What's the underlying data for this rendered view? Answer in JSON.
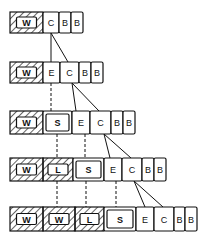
{
  "diagram": {
    "kind": "stack-of-cell-rows",
    "line_color": "#111111",
    "background": "#ffffff",
    "rows": [
      {
        "y": 12,
        "h": 21,
        "cells": [
          {
            "label": "W",
            "x": 10,
            "w": 33,
            "style": "hatched"
          },
          {
            "label": "C",
            "x": 43,
            "w": 16,
            "style": "plain"
          },
          {
            "label": "B",
            "x": 59,
            "w": 12,
            "style": "plain"
          },
          {
            "label": "B",
            "x": 71,
            "w": 12,
            "style": "plain"
          }
        ]
      },
      {
        "y": 62,
        "h": 21,
        "cells": [
          {
            "label": "W",
            "x": 10,
            "w": 33,
            "style": "hatched"
          },
          {
            "label": "E",
            "x": 43,
            "w": 17,
            "style": "plain"
          },
          {
            "label": "C",
            "x": 60,
            "w": 19,
            "style": "plain"
          },
          {
            "label": "B",
            "x": 79,
            "w": 12,
            "style": "plain"
          },
          {
            "label": "B",
            "x": 91,
            "w": 12,
            "style": "plain"
          }
        ]
      },
      {
        "y": 111,
        "h": 23,
        "cells": [
          {
            "label": "W",
            "x": 10,
            "w": 33,
            "style": "hatched"
          },
          {
            "label": "S",
            "x": 43,
            "w": 29,
            "style": "double"
          },
          {
            "label": "E",
            "x": 72,
            "w": 18,
            "style": "plain"
          },
          {
            "label": "C",
            "x": 90,
            "w": 21,
            "style": "plain"
          },
          {
            "label": "B",
            "x": 111,
            "w": 12,
            "style": "plain"
          },
          {
            "label": "B",
            "x": 123,
            "w": 12,
            "style": "plain"
          }
        ]
      },
      {
        "y": 158,
        "h": 23,
        "cells": [
          {
            "label": "W",
            "x": 10,
            "w": 33,
            "style": "hatched"
          },
          {
            "label": "L",
            "x": 43,
            "w": 30,
            "style": "hatched"
          },
          {
            "label": "S",
            "x": 73,
            "w": 31,
            "style": "double"
          },
          {
            "label": "E",
            "x": 104,
            "w": 18,
            "style": "plain"
          },
          {
            "label": "C",
            "x": 122,
            "w": 20,
            "style": "plain"
          },
          {
            "label": "B",
            "x": 142,
            "w": 12,
            "style": "plain"
          },
          {
            "label": "B",
            "x": 154,
            "w": 12,
            "style": "plain"
          }
        ]
      },
      {
        "y": 207,
        "h": 24,
        "cells": [
          {
            "label": "W",
            "x": 10,
            "w": 33,
            "style": "hatched"
          },
          {
            "label": "W",
            "x": 43,
            "w": 32,
            "style": "hatched"
          },
          {
            "label": "L",
            "x": 75,
            "w": 29,
            "style": "hatched"
          },
          {
            "label": "S",
            "x": 104,
            "w": 32,
            "style": "double"
          },
          {
            "label": "E",
            "x": 136,
            "w": 18,
            "style": "plain"
          },
          {
            "label": "C",
            "x": 154,
            "w": 20,
            "style": "plain"
          },
          {
            "label": "B",
            "x": 174,
            "w": 11,
            "style": "plain"
          },
          {
            "label": "B",
            "x": 185,
            "w": 12,
            "style": "plain"
          }
        ]
      }
    ],
    "connectors": [
      {
        "type": "solid",
        "x1": 51,
        "y1": 33,
        "x2": 51,
        "y2": 62
      },
      {
        "type": "solid",
        "x1": 51,
        "y1": 33,
        "x2": 68,
        "y2": 62
      },
      {
        "type": "dashed",
        "x1": 51,
        "y1": 83,
        "x2": 51,
        "y2": 111
      },
      {
        "type": "solid",
        "x1": 72,
        "y1": 83,
        "x2": 76,
        "y2": 111
      },
      {
        "type": "solid",
        "x1": 72,
        "y1": 83,
        "x2": 99,
        "y2": 111
      },
      {
        "type": "dashed",
        "x1": 57,
        "y1": 134,
        "x2": 57,
        "y2": 158
      },
      {
        "type": "dashed",
        "x1": 85,
        "y1": 134,
        "x2": 85,
        "y2": 158
      },
      {
        "type": "solid",
        "x1": 104,
        "y1": 134,
        "x2": 110,
        "y2": 158
      },
      {
        "type": "solid",
        "x1": 104,
        "y1": 134,
        "x2": 131,
        "y2": 158
      },
      {
        "type": "dashed",
        "x1": 57,
        "y1": 181,
        "x2": 57,
        "y2": 207
      },
      {
        "type": "dashed",
        "x1": 86,
        "y1": 181,
        "x2": 86,
        "y2": 207
      },
      {
        "type": "dashed",
        "x1": 116,
        "y1": 181,
        "x2": 116,
        "y2": 207
      },
      {
        "type": "solid",
        "x1": 134,
        "y1": 181,
        "x2": 145,
        "y2": 207
      },
      {
        "type": "solid",
        "x1": 134,
        "y1": 181,
        "x2": 163,
        "y2": 207
      }
    ]
  }
}
